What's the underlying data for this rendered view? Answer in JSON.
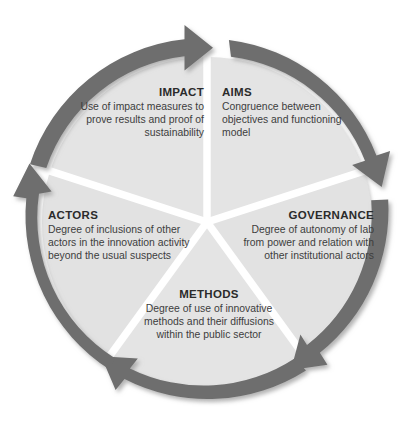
{
  "diagram": {
    "type": "circular-cycle-wheel",
    "shape": "five-segment pie with clockwise circular arrow ring",
    "colors": {
      "arrow_ring": "#6e6e6e",
      "arrow_ring_shadow": "#8a8a8a",
      "segment_fill": "#e4e4e4",
      "segment_fill_alt": "#e0e0e0",
      "segment_divider": "#ffffff",
      "background": "#ffffff",
      "title_text": "#2b2b2b",
      "body_text": "#3d3d3d"
    },
    "arrow_direction": "clockwise",
    "arrow_count": 5,
    "segments": [
      {
        "key": "impact",
        "title": "IMPACT",
        "body": "Use of impact measures to prove results and proof of sustainability",
        "align": "right",
        "position": "upper-left"
      },
      {
        "key": "aims",
        "title": "AIMS",
        "body": "Congruence between objectives and functioning model",
        "align": "left",
        "position": "upper-right"
      },
      {
        "key": "governance",
        "title": "GOVERNANCE",
        "body": "Degree of autonomy of lab from power and relation with other institutional actors",
        "align": "right",
        "position": "right"
      },
      {
        "key": "methods",
        "title": "METHODS",
        "body": "Degree of use of innovative methods and their diffusions within the public sector",
        "align": "center",
        "position": "bottom"
      },
      {
        "key": "actors",
        "title": "ACTORS",
        "body": "Degree of inclusions of other actors in the innovation activity beyond the usual suspects",
        "align": "left",
        "position": "left"
      }
    ]
  }
}
